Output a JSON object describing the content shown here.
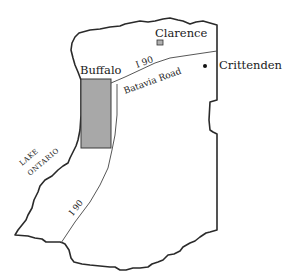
{
  "map": {
    "colors": {
      "background": "#ffffff",
      "boundary": "#2a2a2a",
      "road": "#444444",
      "buffalo_fill": "#a8a8a8",
      "clarence_fill": "#b0b0b0",
      "text": "#1a1a1a"
    },
    "places": [
      {
        "name": "Clarence",
        "marker": "square"
      },
      {
        "name": "Buffalo",
        "marker": "shaded-rectangle"
      },
      {
        "name": "Crittenden",
        "marker": "dot"
      }
    ],
    "roads": [
      {
        "name": "I 90"
      },
      {
        "name": "Batavia Road"
      },
      {
        "name": "I 90 (south)"
      }
    ],
    "water": {
      "line1": "LAKE",
      "line2": "ONTARIO"
    },
    "labels": {
      "clarence": "Clarence",
      "buffalo": "Buffalo",
      "crittenden": "Crittenden",
      "i90_north": "I 90",
      "i90_south": "I 90",
      "batavia_road": "Batavia Road",
      "lake_line1": "LAKE",
      "lake_line2": "ONTARIO"
    }
  }
}
